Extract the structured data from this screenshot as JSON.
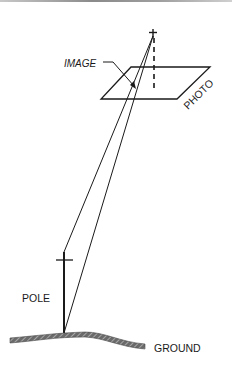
{
  "figure": {
    "labels": {
      "image": "IMAGE",
      "photo": "PHOTO",
      "pole": "POLE",
      "ground": "GROUND"
    }
  }
}
